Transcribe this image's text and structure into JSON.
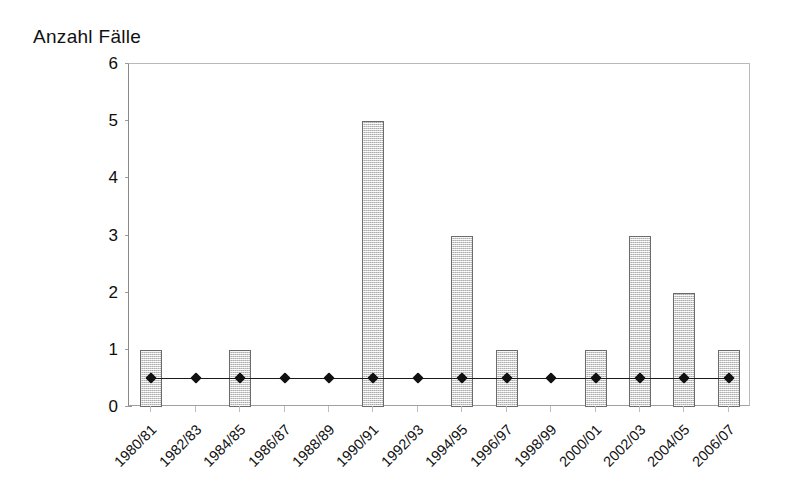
{
  "chart_data": {
    "type": "bar",
    "title": "Anzahl Fälle",
    "xlabel": "",
    "ylabel": "Anzahl Fälle",
    "ylim": [
      0,
      6
    ],
    "yticks": [
      0,
      1,
      2,
      3,
      4,
      5,
      6
    ],
    "ytick_labels": [
      "0",
      "1",
      "2",
      "3",
      "4",
      "5",
      "6"
    ],
    "grid": false,
    "legend": "none",
    "categories": [
      "1980/81",
      "1982/83",
      "1984/85",
      "1986/87",
      "1988/89",
      "1990/91",
      "1992/93",
      "1994/95",
      "1996/97",
      "1998/99",
      "2000/01",
      "2002/03",
      "2004/05",
      "2006/07"
    ],
    "series": [
      {
        "name": "Anzahl Fälle",
        "kind": "bar",
        "values": [
          1,
          0,
          1,
          0,
          0,
          5,
          0,
          3,
          1,
          0,
          1,
          3,
          2,
          1
        ]
      },
      {
        "name": "Referenzlinie",
        "kind": "line",
        "marker": "diamond",
        "values": [
          0.5,
          0.5,
          0.5,
          0.5,
          0.5,
          0.5,
          0.5,
          0.5,
          0.5,
          0.5,
          0.5,
          0.5,
          0.5,
          0.5
        ]
      }
    ]
  },
  "colors": {
    "bar_fill": "#d9d9d9",
    "bar_border": "#6b6b6b",
    "line": "#1a1a1a",
    "marker": "#111111",
    "axis": "#8a8a8a",
    "text": "#111111",
    "background": "#ffffff"
  }
}
